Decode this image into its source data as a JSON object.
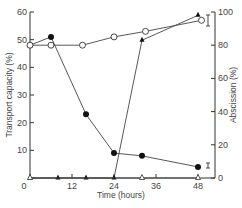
{
  "chart_data": {
    "type": "line",
    "title": "",
    "xlabel": "Time (hours)",
    "ylabel": "Transport capacity (%)",
    "y2label": "Abscission (%)",
    "x_ticks": [
      0,
      12,
      24,
      36,
      48
    ],
    "x_tick_labels": [
      "0",
      "12",
      "24",
      "36",
      "48"
    ],
    "y_ticks": [
      0,
      10,
      20,
      30,
      40,
      50,
      60
    ],
    "y_tick_labels": [
      "",
      "10",
      "20",
      "30",
      "40",
      "50",
      "60"
    ],
    "y2_ticks": [
      0,
      20,
      40,
      60,
      80,
      100
    ],
    "y2_tick_labels": [
      "0",
      "20",
      "40",
      "60",
      "80",
      "100"
    ],
    "xlim": [
      0,
      50
    ],
    "ylim": [
      0,
      62
    ],
    "y2lim": [
      0,
      102
    ],
    "grid": false,
    "legend": "none",
    "series": [
      {
        "name": "Transport capacity (filled circles)",
        "axis": "left",
        "marker": "filled-circle",
        "x": [
          0,
          6,
          16,
          24,
          32,
          48
        ],
        "values": [
          48,
          51,
          23,
          9,
          8,
          4
        ]
      },
      {
        "name": "Transport capacity (open circles)",
        "axis": "left",
        "marker": "open-circle",
        "x": [
          0,
          6,
          15,
          24,
          33,
          49
        ],
        "values": [
          48,
          48,
          48,
          51,
          53,
          57
        ]
      },
      {
        "name": "Abscission (filled triangles)",
        "axis": "right",
        "marker": "filled-triangle",
        "x": [
          0,
          8,
          16,
          24,
          32,
          48
        ],
        "values": [
          0,
          0,
          0,
          0,
          83,
          98
        ]
      },
      {
        "name": "Abscission (open triangles)",
        "axis": "right",
        "marker": "open-triangle",
        "x": [
          0,
          32,
          48
        ],
        "values": [
          0,
          0,
          0
        ]
      }
    ],
    "annotations": [
      {
        "type": "error-bar",
        "near": "48h top",
        "axis": "left"
      },
      {
        "type": "error-bar",
        "near": "48h bottom",
        "axis": "left"
      }
    ]
  }
}
